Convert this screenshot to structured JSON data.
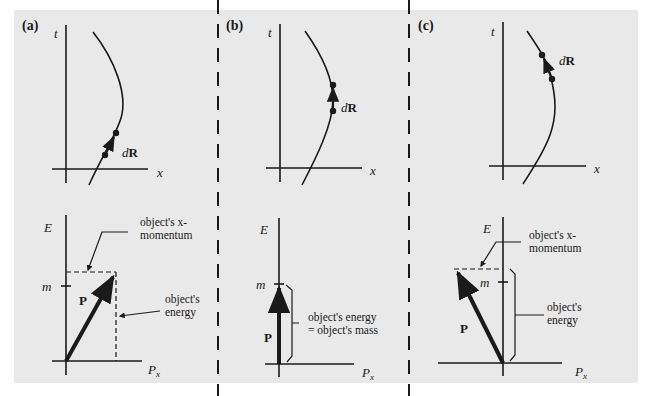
{
  "figure": {
    "background": "#e9e9e9",
    "ink": "#1a1a1a",
    "panels": [
      {
        "label": "(a)",
        "spacetime": {
          "t_label": "t",
          "x_label": "x",
          "vector_label_d": "d",
          "vector_label_R": "R"
        },
        "energy_momentum": {
          "E_label": "E",
          "m_label": "m",
          "P_label": "P",
          "Px_label": "P",
          "Px_sub": "x",
          "callout_momentum_line1": "object's x-",
          "callout_momentum_line2": "momentum",
          "callout_energy_line1": "object's",
          "callout_energy_line2": "energy"
        }
      },
      {
        "label": "(b)",
        "spacetime": {
          "t_label": "t",
          "x_label": "x",
          "vector_label_d": "d",
          "vector_label_R": "R"
        },
        "energy_momentum": {
          "E_label": "E",
          "m_label": "m",
          "P_label": "P",
          "Px_label": "P",
          "Px_sub": "x",
          "callout_line1": "object's energy",
          "callout_line2": "=  object's mass"
        }
      },
      {
        "label": "(c)",
        "spacetime": {
          "t_label": "t",
          "x_label": "x",
          "vector_label_d": "d",
          "vector_label_R": "R"
        },
        "energy_momentum": {
          "E_label": "E",
          "m_label": "m",
          "P_label": "P",
          "Px_label": "P",
          "Px_sub": "x",
          "callout_momentum_line1": "object's x-",
          "callout_momentum_line2": "momentum",
          "callout_energy_line1": "object's",
          "callout_energy_line2": "energy"
        }
      }
    ]
  }
}
